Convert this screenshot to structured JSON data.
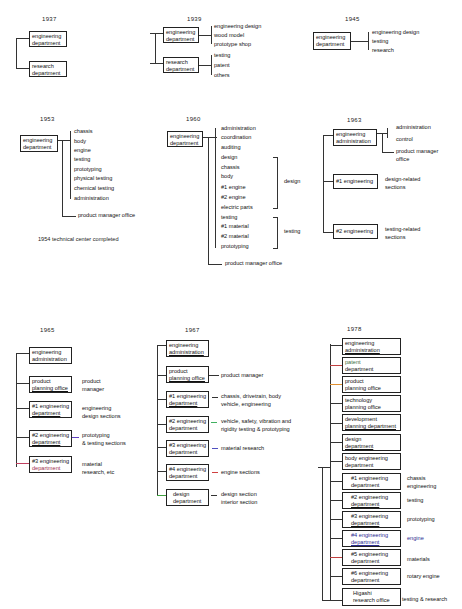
{
  "charts": {
    "y1937": {
      "year": "1937",
      "boxes": [
        {
          "l1": "engineering",
          "l2": "department"
        },
        {
          "l1": "research",
          "l2": "department"
        }
      ]
    },
    "y1939": {
      "year": "1939",
      "boxes": [
        {
          "l1": "engineering",
          "l2": "department",
          "children": [
            "engineering design",
            "wood model",
            "prototype shop"
          ]
        },
        {
          "l1": "research",
          "l2": "department",
          "children": [
            "testing",
            "patent",
            "others"
          ]
        }
      ]
    },
    "y1945": {
      "year": "1945",
      "box": {
        "l1": "engineering",
        "l2": "department"
      },
      "children": [
        "engineering design",
        "testing",
        "research"
      ]
    },
    "y1953": {
      "year": "1953",
      "box": {
        "l1": "engineering",
        "l2": "department"
      },
      "children": [
        "chassis",
        "body",
        "engine",
        "testing",
        "prototyping",
        "physical testing",
        "chemical testing",
        "administration"
      ],
      "extra": "product manager office",
      "note": "1954  technical center completed"
    },
    "y1960": {
      "year": "1960",
      "box": {
        "l1": "engineering",
        "l2": "department"
      },
      "children": [
        "administration",
        "coordination",
        "auditing",
        "design",
        "chassis",
        "body",
        "#1 engine",
        "#2 engine",
        "electric parts",
        "testing",
        "#1 material",
        "#2 material",
        "prototyping"
      ],
      "group_design": "design",
      "group_testing": "testing",
      "extra": "product manager office"
    },
    "y1963": {
      "year": "1963",
      "boxes": [
        {
          "l1": "engineering",
          "l2": "administration",
          "children": [
            "administration",
            "control",
            "product manager",
            "office"
          ]
        },
        {
          "l1": "#1 engineering",
          "desc1": "design-related",
          "desc2": "sections"
        },
        {
          "l1": "#2 engineering",
          "desc1": "testing-related",
          "desc2": "sections"
        }
      ]
    },
    "y1965": {
      "year": "1965",
      "boxes": [
        {
          "l1": "engineering",
          "l2": "administration"
        },
        {
          "l1": "product",
          "l2": "planning office",
          "d1": "product",
          "d2": "manager"
        },
        {
          "l1": "#1 engineering",
          "l2": "department",
          "d1": "engineering",
          "d2": "design sections"
        },
        {
          "l1": "#2 engineering",
          "l2": "department",
          "d1": "prototyping",
          "d2": "& testing sections"
        },
        {
          "l1": "#3 engineering",
          "l2": "department",
          "d1": "material",
          "d2": "research, etc"
        }
      ]
    },
    "y1967": {
      "year": "1967",
      "boxes": [
        {
          "l1": "engineering",
          "l2": "administration"
        },
        {
          "l1": "product",
          "l2": "planning office",
          "d1": "product manager"
        },
        {
          "l1": "#1 engineering",
          "l2": "department",
          "d1": "chassis, drivetrain, body",
          "d2": "vehicle, engineering"
        },
        {
          "l1": "#2 engineering",
          "l2": "department",
          "d1": "vehicle, safety, vibration and",
          "d2": "rigidity testing & prototyping"
        },
        {
          "l1": "#3 engineering",
          "l2": "department",
          "d1": "material research"
        },
        {
          "l1": "#4 engineering",
          "l2": "department",
          "d1": "engine sections"
        },
        {
          "l1": "design",
          "l2": "department",
          "d1": "design section",
          "d2": "interior section"
        }
      ]
    },
    "y1978": {
      "year": "1978",
      "boxes": [
        {
          "l1": "engineering",
          "l2": "administration"
        },
        {
          "l1": "patent",
          "l2": "department"
        },
        {
          "l1": "product",
          "l2": "planning office"
        },
        {
          "l1": "technology",
          "l2": "planning office"
        },
        {
          "l1": "development",
          "l2": "planning department"
        },
        {
          "l1": "design",
          "l2": "department"
        },
        {
          "l1": "body engineering",
          "l2": "department"
        },
        {
          "l1": "#1 engineering",
          "l2": "department",
          "d1": "chassis",
          "d2": "engineering"
        },
        {
          "l1": "#2 engineering",
          "l2": "department",
          "d1": "testing"
        },
        {
          "l1": "#3 engineering",
          "l2": "department",
          "d1": "prototyping"
        },
        {
          "l1": "#4 engineering",
          "l2": "department",
          "d1": "engine"
        },
        {
          "l1": "#5 engineering",
          "l2": "department",
          "d1": "materials"
        },
        {
          "l1": "#6 engineering",
          "l2": "department",
          "d1": "rotary engine"
        },
        {
          "l1": "Higashi",
          "l2": "research office",
          "d1": "testing & research"
        }
      ]
    }
  }
}
